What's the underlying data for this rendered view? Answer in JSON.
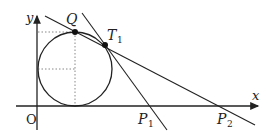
{
  "diagram": {
    "type": "geometry",
    "labels": {
      "y_axis": "y",
      "x_axis": "x",
      "origin": "O",
      "point_q": "Q",
      "point_t": "T",
      "point_t_sub": "1",
      "point_p1": "P",
      "point_p1_sub": "1",
      "point_p2": "P",
      "point_p2_sub": "2"
    },
    "circle": {
      "cx": 75,
      "cy": 69,
      "r": 37
    },
    "points": {
      "Q": [
        75,
        32
      ],
      "T1": [
        105,
        45
      ]
    },
    "colors": {
      "stroke": "#222222",
      "dotted": "#888888"
    }
  }
}
